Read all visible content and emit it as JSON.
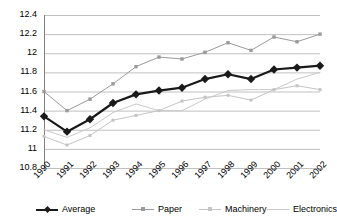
{
  "chart_data": {
    "type": "line",
    "title": "",
    "xlabel": "",
    "ylabel": "",
    "categories": [
      "1990",
      "1991",
      "1992",
      "1993",
      "1994",
      "1995",
      "1996",
      "1997",
      "1998",
      "1999",
      "2000",
      "2001",
      "2002"
    ],
    "ylim": [
      10.8,
      12.4
    ],
    "xlim_labels": [
      "1990",
      "2002"
    ],
    "yticks": [
      "12.4",
      "12.2",
      "12",
      "11.8",
      "11.6",
      "11.4",
      "11.2",
      "11",
      "10.8"
    ],
    "ytick_values": [
      12.4,
      12.2,
      12.0,
      11.8,
      11.6,
      11.4,
      11.2,
      11.0,
      10.8
    ],
    "grid": true,
    "legend_position": "bottom",
    "series": [
      {
        "name": "Average",
        "color": "#1a1a1a",
        "width": 2.2,
        "marker": "diamond",
        "marker_size": 4.2,
        "values": [
          11.34,
          11.18,
          11.31,
          11.48,
          11.57,
          11.61,
          11.64,
          11.73,
          11.78,
          11.73,
          11.83,
          11.85,
          11.87
        ]
      },
      {
        "name": "Paper",
        "color": "#9a9a9a",
        "width": 1.0,
        "marker": "square",
        "marker_size": 3.4,
        "values": [
          11.6,
          11.4,
          11.52,
          11.68,
          11.86,
          11.96,
          11.94,
          12.01,
          12.11,
          12.03,
          12.17,
          12.12,
          12.2
        ]
      },
      {
        "name": "Machinery",
        "color": "#c4c4c4",
        "width": 1.0,
        "marker": "square",
        "marker_size": 3.0,
        "values": [
          11.13,
          11.04,
          11.14,
          11.3,
          11.35,
          11.4,
          11.5,
          11.54,
          11.56,
          11.51,
          11.62,
          11.66,
          11.62
        ]
      },
      {
        "name": "Electronics",
        "color": "#c9c9c9",
        "width": 1.0,
        "marker": "none",
        "marker_size": 0,
        "values": [
          11.2,
          11.12,
          11.22,
          11.38,
          11.47,
          11.4,
          11.4,
          11.52,
          11.61,
          11.62,
          11.62,
          11.73,
          11.8
        ]
      }
    ],
    "axis_color": "#808080",
    "grid_color": "#b0b0b0",
    "background": "#ffffff"
  },
  "legend": {
    "items": [
      {
        "label": "Average"
      },
      {
        "label": "Paper"
      },
      {
        "label": "Machinery"
      },
      {
        "label": "Electronics"
      }
    ]
  }
}
